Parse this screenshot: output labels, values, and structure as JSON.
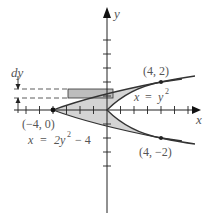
{
  "diagram": {
    "axes": {
      "x_label": "x",
      "y_label": "y"
    },
    "curves": [
      {
        "name": "x = y^2",
        "label_lhs": "x",
        "label_eq": "=",
        "label_base": "y",
        "label_exp": "2"
      },
      {
        "name": "x = 2y^2 - 4",
        "label_lhs": "x",
        "label_eq": "=",
        "label_coef": "2y",
        "label_exp": "2",
        "label_tail": "− 4"
      }
    ],
    "points": [
      {
        "label": "(4, 2)",
        "x": 4,
        "y": 2
      },
      {
        "label": "(4, −2)",
        "x": 4,
        "y": -2
      },
      {
        "label": "(−4, 0)",
        "x": -4,
        "y": 0
      }
    ],
    "strip": {
      "label": "dy"
    },
    "colors": {
      "region_fill": "#d4d4d4",
      "strip_fill": "#bdbdbd",
      "curve_stroke": "#333333",
      "axis_stroke": "#222222",
      "label_text": "#555555"
    }
  }
}
